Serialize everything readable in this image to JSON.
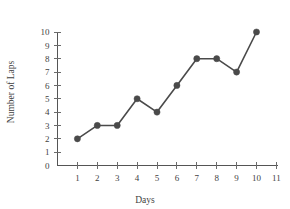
{
  "chart_data": {
    "type": "line",
    "title": "",
    "xlabel": "Days",
    "ylabel": "Number of Laps",
    "x": [
      1,
      2,
      3,
      4,
      5,
      6,
      7,
      8,
      9,
      10
    ],
    "values": [
      2,
      3,
      3,
      5,
      4,
      6,
      8,
      8,
      7,
      10
    ],
    "series": [
      {
        "name": "Laps",
        "values": [
          2,
          3,
          3,
          5,
          4,
          6,
          8,
          8,
          7,
          10
        ]
      }
    ],
    "xlim": [
      0,
      11
    ],
    "ylim": [
      0,
      10
    ],
    "xticks": [
      1,
      2,
      3,
      4,
      5,
      6,
      7,
      8,
      9,
      10,
      11
    ],
    "yticks": [
      0,
      1,
      2,
      3,
      4,
      5,
      6,
      7,
      8,
      9,
      10
    ],
    "xtick_labels": [
      "1",
      "2",
      "3",
      "4",
      "5",
      "6",
      "7",
      "8",
      "9",
      "10",
      "11"
    ],
    "ytick_labels": [
      "0",
      "1",
      "2",
      "3",
      "4",
      "5",
      "6",
      "7",
      "8",
      "9",
      "10"
    ],
    "grid": false,
    "legend": false,
    "legend_position": "none",
    "marker": "filled-circle",
    "line_color": "#4a4a4a",
    "marker_color": "#4a4a4a",
    "axis_color": "#555555",
    "background_color": "#ffffff"
  }
}
